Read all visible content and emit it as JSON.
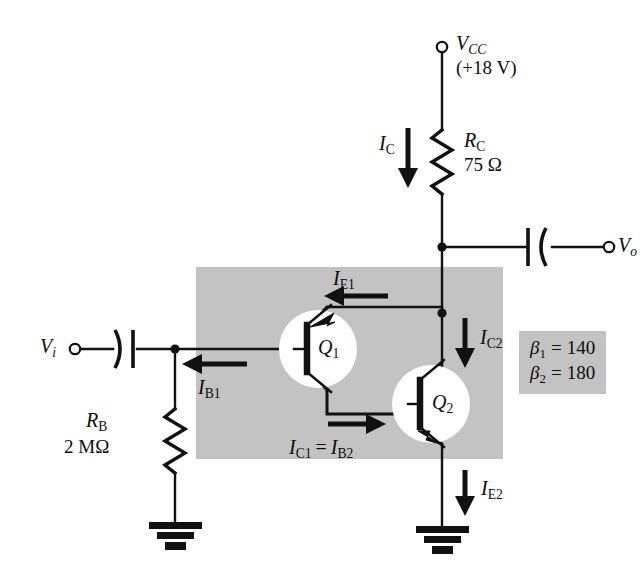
{
  "figure": {
    "kind": "circuit-schematic",
    "shaded_region_color": "#c3c3c3",
    "line_color": "#111111",
    "background": "#ffffff"
  },
  "terminals": {
    "supply": {
      "name": "V",
      "sub": "CC",
      "value": "(+18 V)"
    },
    "input": {
      "name": "V",
      "sub": "i"
    },
    "output": {
      "name": "V",
      "sub": "o"
    }
  },
  "components": {
    "rc": {
      "ref": "R",
      "sub": "C",
      "value": "75 Ω"
    },
    "rb": {
      "ref": "R",
      "sub": "B",
      "value": "2 MΩ"
    },
    "q1": {
      "ref": "Q",
      "sub": "1",
      "type": "pnp"
    },
    "q2": {
      "ref": "Q",
      "sub": "2",
      "type": "npn"
    },
    "c_in": {
      "name": "input-coupling-capacitor"
    },
    "c_out": {
      "name": "output-coupling-capacitor"
    }
  },
  "currents": [
    {
      "id": "ic",
      "sym": "I",
      "sub": "C",
      "direction": "down",
      "label": "I_C"
    },
    {
      "id": "ie1",
      "sym": "I",
      "sub": "E1",
      "direction": "left",
      "label": "I_E1"
    },
    {
      "id": "ib1",
      "sym": "I",
      "sub": "B1",
      "direction": "left",
      "label": "I_B1"
    },
    {
      "id": "ic2",
      "sym": "I",
      "sub": "C2",
      "direction": "down",
      "label": "I_C2"
    },
    {
      "id": "ic1",
      "sym": "I",
      "sub": "C1",
      "direction": "right",
      "label": "I_C1 = I_B2",
      "equals": "=",
      "sym2": "I",
      "sub2": "B2"
    },
    {
      "id": "ie2",
      "sym": "I",
      "sub": "E2",
      "direction": "down",
      "label": "I_E2"
    }
  ],
  "parameters": {
    "beta1": {
      "sym": "β",
      "sub": "1",
      "eq": "=",
      "value": "140"
    },
    "beta2": {
      "sym": "β",
      "sub": "2",
      "eq": "=",
      "value": "180"
    }
  },
  "grounds": [
    {
      "id": "ground-rb",
      "name": "ground-symbol-left"
    },
    {
      "id": "ground-q2",
      "name": "ground-symbol-right"
    }
  ]
}
